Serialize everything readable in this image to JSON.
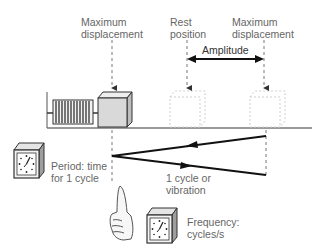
{
  "labels": {
    "max_disp_left": [
      "Maximum",
      "displacement"
    ],
    "rest_position": [
      "Rest",
      "position"
    ],
    "max_disp_right": [
      "Maximum",
      "displacement"
    ],
    "amplitude": "Amplitude",
    "period": [
      "Period: time",
      "for 1 cycle"
    ],
    "cycle": [
      "1 cycle or",
      "vibration"
    ],
    "frequency": [
      "Frequency:",
      "cycles/s"
    ]
  },
  "icons": {
    "spring": "spring-icon",
    "mass_block": "block-icon",
    "ghost_block_rest": "dashed-block-icon",
    "ghost_block_max": "dashed-block-icon",
    "clock_period": "clock-icon",
    "clock_frequency": "clock-icon",
    "hand": "raised-index-finger-icon"
  },
  "colors": {
    "text": "#666666",
    "line": "#1a1a1a",
    "dashed": "#888888",
    "block_fill": "#d9d9d9",
    "floor": "#9a9a9a"
  }
}
